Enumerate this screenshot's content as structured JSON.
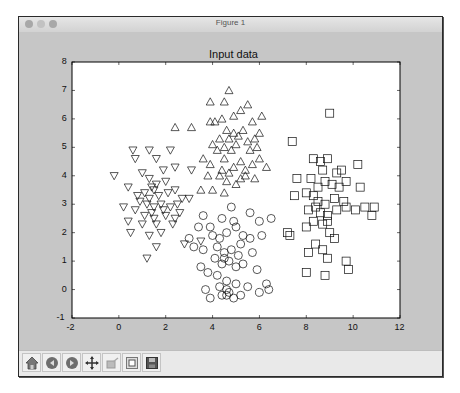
{
  "window": {
    "title": "Figure 1",
    "traffic_lights": [
      "close",
      "minimize",
      "zoom"
    ]
  },
  "toolbar": {
    "buttons": [
      {
        "name": "home",
        "icon": "home-icon"
      },
      {
        "name": "back",
        "icon": "back-arrow-icon"
      },
      {
        "name": "forward",
        "icon": "forward-arrow-icon"
      },
      {
        "name": "pan",
        "icon": "pan-cross-arrows-icon"
      },
      {
        "name": "zoom",
        "icon": "zoom-rect-icon"
      },
      {
        "name": "subplots",
        "icon": "subplots-config-icon"
      },
      {
        "name": "save",
        "icon": "save-floppy-icon"
      }
    ]
  },
  "chart_data": {
    "type": "scatter",
    "title": "Input data",
    "xlabel": "",
    "ylabel": "",
    "xlim": [
      -2,
      12
    ],
    "ylim": [
      -1,
      8
    ],
    "xticks": [
      -2,
      0,
      2,
      4,
      6,
      8,
      10,
      12
    ],
    "yticks": [
      -1,
      0,
      1,
      2,
      3,
      4,
      5,
      6,
      7,
      8
    ],
    "grid": false,
    "legend": null,
    "series": [
      {
        "name": "cluster-triangle-up",
        "marker": "^",
        "points": [
          [
            4.7,
            7.0
          ],
          [
            3.9,
            6.6
          ],
          [
            4.5,
            6.6
          ],
          [
            5.5,
            6.5
          ],
          [
            2.4,
            5.7
          ],
          [
            3.1,
            5.7
          ],
          [
            3.9,
            5.9
          ],
          [
            4.1,
            5.9
          ],
          [
            4.4,
            6.0
          ],
          [
            4.9,
            6.1
          ],
          [
            5.2,
            6.3
          ],
          [
            5.7,
            5.9
          ],
          [
            6.1,
            6.1
          ],
          [
            6.0,
            5.5
          ],
          [
            4.6,
            5.6
          ],
          [
            4.7,
            5.3
          ],
          [
            4.9,
            5.5
          ],
          [
            5.1,
            5.4
          ],
          [
            5.3,
            5.6
          ],
          [
            5.5,
            5.2
          ],
          [
            5.8,
            5.3
          ],
          [
            4.3,
            5.3
          ],
          [
            4.0,
            5.1
          ],
          [
            4.2,
            4.9
          ],
          [
            4.5,
            5.0
          ],
          [
            4.8,
            4.9
          ],
          [
            5.0,
            5.1
          ],
          [
            5.6,
            4.9
          ],
          [
            5.9,
            5.0
          ],
          [
            3.6,
            4.6
          ],
          [
            3.9,
            4.4
          ],
          [
            4.5,
            4.6
          ],
          [
            5.2,
            4.5
          ],
          [
            5.4,
            4.2
          ],
          [
            5.7,
            4.4
          ],
          [
            6.0,
            4.6
          ],
          [
            3.8,
            4.0
          ],
          [
            4.3,
            4.0
          ],
          [
            4.6,
            3.8
          ],
          [
            5.0,
            3.7
          ],
          [
            4.5,
            3.4
          ],
          [
            3.5,
            3.5
          ],
          [
            4.0,
            3.5
          ],
          [
            5.4,
            4.0
          ],
          [
            4.9,
            4.3
          ],
          [
            4.4,
            4.2
          ],
          [
            5.2,
            3.9
          ],
          [
            4.7,
            4.1
          ],
          [
            5.8,
            3.9
          ],
          [
            6.3,
            4.3
          ]
        ]
      },
      {
        "name": "cluster-triangle-down",
        "marker": "v",
        "points": [
          [
            0.6,
            4.9
          ],
          [
            0.7,
            4.6
          ],
          [
            1.3,
            4.9
          ],
          [
            1.6,
            4.6
          ],
          [
            2.2,
            4.9
          ],
          [
            1.9,
            4.2
          ],
          [
            2.4,
            4.3
          ],
          [
            3.1,
            4.2
          ],
          [
            -0.2,
            4.0
          ],
          [
            1.0,
            4.1
          ],
          [
            1.3,
            3.9
          ],
          [
            1.6,
            3.7
          ],
          [
            2.0,
            3.8
          ],
          [
            1.4,
            3.6
          ],
          [
            1.5,
            3.5
          ],
          [
            0.4,
            3.6
          ],
          [
            0.8,
            3.3
          ],
          [
            1.1,
            3.4
          ],
          [
            1.7,
            3.3
          ],
          [
            2.1,
            3.4
          ],
          [
            2.4,
            3.5
          ],
          [
            2.7,
            3.2
          ],
          [
            3.0,
            3.2
          ],
          [
            0.9,
            3.1
          ],
          [
            1.2,
            3.0
          ],
          [
            1.5,
            2.9
          ],
          [
            1.8,
            3.0
          ],
          [
            2.2,
            2.9
          ],
          [
            0.7,
            2.8
          ],
          [
            1.4,
            2.7
          ],
          [
            2.0,
            2.6
          ],
          [
            2.6,
            2.7
          ],
          [
            0.4,
            2.4
          ],
          [
            1.0,
            2.3
          ],
          [
            1.6,
            2.3
          ],
          [
            2.3,
            2.3
          ],
          [
            0.5,
            2.0
          ],
          [
            1.3,
            1.9
          ],
          [
            1.8,
            2.0
          ],
          [
            1.6,
            1.5
          ],
          [
            2.8,
            1.6
          ],
          [
            1.2,
            1.1
          ],
          [
            1.5,
            2.5
          ],
          [
            1.1,
            2.6
          ],
          [
            1.9,
            2.8
          ],
          [
            2.5,
            3.0
          ],
          [
            0.2,
            2.9
          ],
          [
            1.3,
            3.2
          ],
          [
            2.4,
            2.5
          ],
          [
            3.5,
            1.7
          ]
        ]
      },
      {
        "name": "cluster-circle",
        "marker": "o",
        "points": [
          [
            4.8,
            2.9
          ],
          [
            3.6,
            2.6
          ],
          [
            4.4,
            2.5
          ],
          [
            5.6,
            2.7
          ],
          [
            6.0,
            2.4
          ],
          [
            6.5,
            2.5
          ],
          [
            3.4,
            2.2
          ],
          [
            3.9,
            2.2
          ],
          [
            4.0,
            1.9
          ],
          [
            4.3,
            1.8
          ],
          [
            4.6,
            2.0
          ],
          [
            5.0,
            2.2
          ],
          [
            5.3,
            1.9
          ],
          [
            5.6,
            1.8
          ],
          [
            6.1,
            1.9
          ],
          [
            3.0,
            1.8
          ],
          [
            3.2,
            1.5
          ],
          [
            3.6,
            1.4
          ],
          [
            4.2,
            1.5
          ],
          [
            4.5,
            1.3
          ],
          [
            4.8,
            1.4
          ],
          [
            5.2,
            1.6
          ],
          [
            5.7,
            1.3
          ],
          [
            4.1,
            1.1
          ],
          [
            4.4,
            0.9
          ],
          [
            4.7,
            1.0
          ],
          [
            5.0,
            0.8
          ],
          [
            5.3,
            0.9
          ],
          [
            5.9,
            0.7
          ],
          [
            3.5,
            0.8
          ],
          [
            3.8,
            0.6
          ],
          [
            4.2,
            0.5
          ],
          [
            4.6,
            0.3
          ],
          [
            5.0,
            0.2
          ],
          [
            5.5,
            0.1
          ],
          [
            6.3,
            0.2
          ],
          [
            4.3,
            0.1
          ],
          [
            4.6,
            0.0
          ],
          [
            4.7,
            -0.1
          ],
          [
            4.4,
            -0.2
          ],
          [
            3.9,
            -0.3
          ],
          [
            3.7,
            0.0
          ],
          [
            5.2,
            -0.2
          ],
          [
            6.0,
            -0.1
          ],
          [
            6.4,
            0.0
          ],
          [
            4.9,
            -0.3
          ],
          [
            4.6,
            -0.2
          ],
          [
            4.5,
            1.1
          ],
          [
            5.1,
            1.2
          ],
          [
            4.9,
            2.4
          ]
        ]
      },
      {
        "name": "cluster-square",
        "marker": "s",
        "points": [
          [
            9.0,
            6.2
          ],
          [
            7.4,
            5.2
          ],
          [
            8.3,
            4.6
          ],
          [
            8.6,
            4.5
          ],
          [
            8.9,
            4.6
          ],
          [
            8.7,
            4.2
          ],
          [
            9.3,
            4.1
          ],
          [
            9.5,
            4.2
          ],
          [
            10.2,
            4.4
          ],
          [
            7.6,
            3.9
          ],
          [
            8.2,
            3.9
          ],
          [
            8.5,
            3.6
          ],
          [
            8.8,
            3.8
          ],
          [
            9.1,
            3.7
          ],
          [
            9.4,
            3.6
          ],
          [
            9.7,
            3.8
          ],
          [
            10.3,
            3.6
          ],
          [
            7.5,
            3.3
          ],
          [
            8.0,
            3.4
          ],
          [
            8.3,
            3.3
          ],
          [
            8.5,
            3.1
          ],
          [
            8.8,
            3.0
          ],
          [
            9.2,
            3.2
          ],
          [
            9.6,
            3.1
          ],
          [
            8.1,
            2.8
          ],
          [
            8.4,
            2.9
          ],
          [
            8.6,
            2.7
          ],
          [
            8.9,
            2.6
          ],
          [
            9.3,
            2.8
          ],
          [
            9.7,
            2.9
          ],
          [
            10.1,
            2.8
          ],
          [
            10.5,
            2.9
          ],
          [
            10.9,
            2.9
          ],
          [
            10.8,
            2.6
          ],
          [
            8.0,
            2.2
          ],
          [
            8.3,
            2.4
          ],
          [
            8.7,
            2.3
          ],
          [
            9.0,
            2.0
          ],
          [
            9.2,
            1.8
          ],
          [
            8.4,
            1.6
          ],
          [
            8.7,
            1.4
          ],
          [
            8.1,
            1.3
          ],
          [
            8.9,
            1.1
          ],
          [
            9.7,
            1.0
          ],
          [
            9.8,
            0.7
          ],
          [
            8.8,
            0.5
          ],
          [
            8.0,
            0.6
          ],
          [
            7.3,
            1.9
          ],
          [
            7.2,
            2.0
          ],
          [
            8.9,
            2.4
          ]
        ]
      }
    ]
  }
}
